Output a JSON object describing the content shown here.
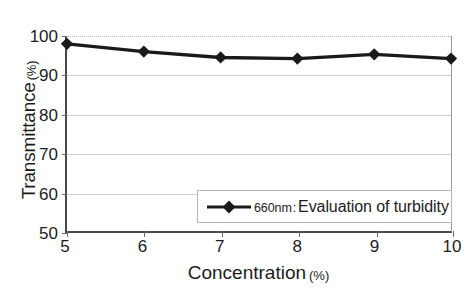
{
  "chart_data": {
    "type": "line",
    "title": "",
    "xlabel": "Concentration",
    "xlabel_unit": "(%)",
    "ylabel": "Transmittance",
    "ylabel_unit": "(%)",
    "x": [
      5,
      6,
      7,
      8,
      9,
      10
    ],
    "xticklabels": [
      "5",
      "6",
      "7",
      "8",
      "9",
      "10"
    ],
    "yticklabels": [
      "50",
      "60",
      "70",
      "80",
      "90",
      "100"
    ],
    "yticks": [
      50,
      60,
      70,
      80,
      90,
      100
    ],
    "xlim": [
      5,
      10
    ],
    "ylim": [
      50,
      100
    ],
    "grid": "horizontal",
    "legend_position": "lower-right",
    "marker": "diamond",
    "line_color": "#1a1a1a",
    "grid_color": "#cfcfcf",
    "axis_color": "#4a4a4a",
    "series": [
      {
        "name": "660nm : Evaluation of turbidity",
        "wavelength": "660nm",
        "separator": ":",
        "description": "Evaluation of turbidity",
        "values": [
          98.0,
          96.0,
          94.5,
          94.2,
          95.3,
          94.2
        ]
      }
    ]
  },
  "legend": {
    "entries": [
      {
        "wavelength": "660nm",
        "separator": ":",
        "label": "Evaluation of turbidity"
      }
    ]
  }
}
